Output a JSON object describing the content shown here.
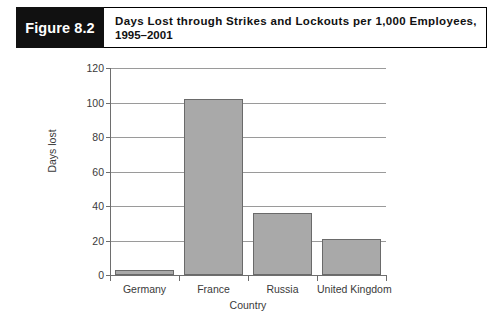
{
  "figure": {
    "tag": "Figure 8.2",
    "title_line1": "Days Lost through Strikes and Lockouts per 1,000 Employees,",
    "title_line2": "1995–2001"
  },
  "colors": {
    "tag_background": "#111111",
    "tag_text": "#ffffff",
    "bar_fill": "#a9a9a9",
    "bar_stroke": "#6a6a6a",
    "gridline": "#9a9a9a",
    "axis": "#6e6e6e",
    "text": "#3a3a3a",
    "page_background": "#ffffff"
  },
  "chart_data": {
    "type": "bar",
    "title": "Days Lost through Strikes and Lockouts per 1,000 Employees, 1995–2001",
    "categories": [
      "Germany",
      "France",
      "Russia",
      "United Kingdom"
    ],
    "values": [
      3,
      102,
      36,
      21
    ],
    "xlabel": "Country",
    "ylabel": "Days lost",
    "ylim": [
      0,
      120
    ],
    "ytick_values": [
      0,
      20,
      40,
      60,
      80,
      100,
      120
    ],
    "ytick_labels": [
      "0",
      "20",
      "40",
      "60",
      "80",
      "100",
      "120"
    ],
    "grid": true,
    "legend": null,
    "legend_position": "none"
  }
}
